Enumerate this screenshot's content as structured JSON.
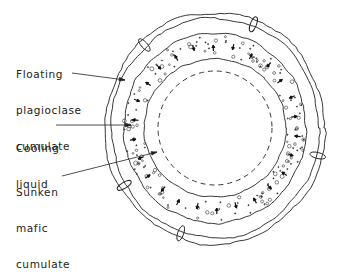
{
  "diagram": {
    "labels": [
      {
        "id": "floating",
        "lines": [
          "Floating",
          "plagioclase",
          "cumulate"
        ]
      },
      {
        "id": "cooling",
        "lines": [
          "Cooling",
          "liquid"
        ]
      },
      {
        "id": "sunken",
        "lines": [
          "Sunken",
          "mafic",
          "cumulate"
        ]
      }
    ],
    "colors": {
      "ink": "#222222",
      "background": "#ffffff"
    }
  }
}
